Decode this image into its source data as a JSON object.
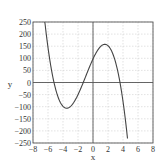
{
  "chart_data": {
    "type": "line",
    "title": "",
    "xlabel": "x",
    "ylabel": "y",
    "xlim": [
      -8,
      8
    ],
    "ylim": [
      -250,
      250
    ],
    "xticks": [
      -8,
      -6,
      -4,
      -2,
      0,
      2,
      4,
      6,
      8
    ],
    "yticks": [
      250,
      200,
      150,
      100,
      50,
      0,
      -50,
      -100,
      -150,
      -200,
      -250
    ],
    "grid": true,
    "legend": null,
    "series": [
      {
        "name": "y = f(x) (cubic)",
        "description": "Cubic with roots near x = -5.2, -1.3, 3.6; local min about (-3.5, -125); local max about (1.7, 150)",
        "x": [
          -6.4,
          -6,
          -5.5,
          -5.2,
          -5,
          -4.5,
          -4,
          -3.5,
          -3,
          -2.5,
          -2,
          -1.5,
          -1.3,
          -1,
          -0.5,
          0,
          0.5,
          1,
          1.5,
          2,
          2.5,
          3,
          3.5,
          3.6,
          4,
          4.5,
          4.6
        ],
        "values": [
          244,
          149,
          47,
          0,
          -24,
          -72,
          -105,
          -116,
          -112,
          -97,
          -74,
          -14,
          0,
          26,
          69,
          97,
          121,
          138,
          148,
          149,
          142,
          124,
          95,
          0,
          -60,
          -211,
          -231
        ]
      }
    ],
    "colors": {
      "curve": "#444444",
      "grid": "#cfcfcf",
      "axis": "#555555",
      "frame": "#555555"
    },
    "roots_approx": [
      -5.2,
      -1.3,
      3.6
    ],
    "local_max_approx": {
      "x": 1.7,
      "y": 150
    },
    "local_min_approx": {
      "x": -3.5,
      "y": -125
    }
  },
  "labels": {
    "x_axis": "x",
    "y_axis": "y",
    "x_ticks": [
      "−8",
      "−6",
      "−4",
      "−2",
      "0",
      "2",
      "4",
      "6",
      "8"
    ],
    "y_ticks": [
      "250",
      "200",
      "150",
      "100",
      "50",
      "0",
      "−50",
      "−100",
      "−150",
      "−200",
      "−250"
    ]
  }
}
